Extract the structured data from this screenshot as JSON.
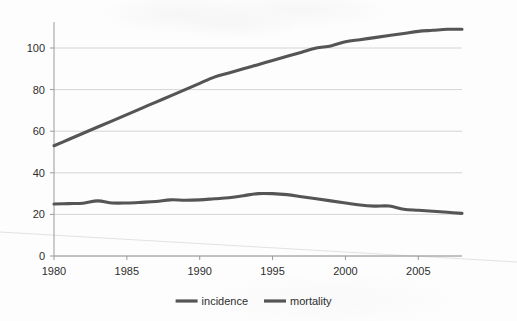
{
  "chart_data": {
    "type": "line",
    "title": "",
    "subtitle": "",
    "xlabel": "",
    "ylabel": "",
    "xlim": [
      1980,
      2008
    ],
    "ylim": [
      0,
      115
    ],
    "xticks": [
      1980,
      1985,
      1990,
      1995,
      2000,
      2005
    ],
    "yticks": [
      0,
      20,
      40,
      60,
      80,
      100
    ],
    "xtick_labels": [
      "1980",
      "1985",
      "1990",
      "1995",
      "2000",
      "2005"
    ],
    "ytick_labels": [
      "0",
      "20",
      "40",
      "60",
      "80",
      "100"
    ],
    "grid": "horizontal",
    "legend_position": "bottom-center",
    "x": [
      1980,
      1981,
      1982,
      1983,
      1984,
      1985,
      1986,
      1987,
      1988,
      1989,
      1990,
      1991,
      1992,
      1993,
      1994,
      1995,
      1996,
      1997,
      1998,
      1999,
      2000,
      2001,
      2002,
      2003,
      2004,
      2005,
      2006,
      2007,
      2008
    ],
    "series": [
      {
        "name": "incidence",
        "color": "#555555",
        "values": [
          53,
          56,
          59,
          62,
          65,
          68,
          71,
          74,
          77,
          80,
          83,
          86,
          88,
          90,
          92,
          94,
          96,
          98,
          100,
          101,
          103,
          104,
          105,
          106,
          107,
          108,
          108.5,
          109,
          109
        ]
      },
      {
        "name": "mortality",
        "color": "#555555",
        "values": [
          25,
          25.2,
          25.4,
          26.5,
          25.5,
          25.5,
          25.8,
          26.2,
          27,
          26.8,
          27,
          27.5,
          28,
          29,
          30,
          30,
          29.5,
          28.5,
          27.5,
          26.5,
          25.5,
          24.5,
          24,
          24,
          22.5,
          22,
          21.5,
          21,
          20.5
        ]
      }
    ],
    "legend": [
      {
        "label": "incidence",
        "color": "#555555"
      },
      {
        "label": "mortality",
        "color": "#555555"
      }
    ]
  },
  "colors": {
    "line": "#555555",
    "grid": "#c9c9c9",
    "axis": "#9a9a9a",
    "text": "#2e2e2e",
    "background": "#fdfdfd"
  }
}
